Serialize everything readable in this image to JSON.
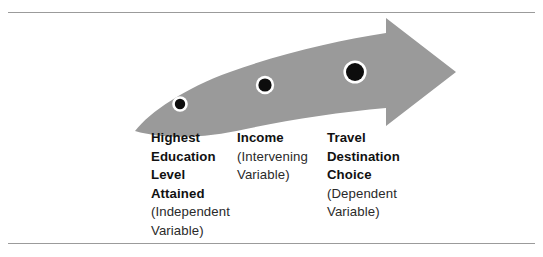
{
  "figure": {
    "title_alt": "Curved arrow diagram of variable relationships",
    "background_color": "#ffffff",
    "rule_color": "#9b9b9b",
    "arrow_color": "#9a9a9a",
    "dot_color": "#0d0d0d",
    "dot_ring_color": "#ffffff",
    "text_color": "#1c1c1c"
  },
  "chart_data": {
    "type": "diagram",
    "title": "",
    "nodes": [
      {
        "index": 0,
        "role": "independent",
        "dot": {
          "cx": 180,
          "cy": 104,
          "r": 5.2
        },
        "lines": [
          {
            "text": "Highest",
            "style": "bold"
          },
          {
            "text": "Education",
            "style": "bold"
          },
          {
            "text": "Level",
            "style": "bold"
          },
          {
            "text": "Attained",
            "style": "bold"
          },
          {
            "text": "(Independent",
            "style": "plain"
          },
          {
            "text": "Variable)",
            "style": "plain"
          }
        ]
      },
      {
        "index": 1,
        "role": "intervening",
        "dot": {
          "cx": 265,
          "cy": 85,
          "r": 6.6
        },
        "lines": [
          {
            "text": "Income",
            "style": "bold"
          },
          {
            "text": "(Intervening",
            "style": "plain"
          },
          {
            "text": "Variable)",
            "style": "plain"
          }
        ]
      },
      {
        "index": 2,
        "role": "dependent",
        "dot": {
          "cx": 355,
          "cy": 72,
          "r": 9.0
        },
        "lines": [
          {
            "text": "Travel",
            "style": "bold"
          },
          {
            "text": "Destination",
            "style": "bold"
          },
          {
            "text": "Choice",
            "style": "bold"
          },
          {
            "text": "(Dependent",
            "style": "plain"
          },
          {
            "text": "Variable)",
            "style": "plain"
          }
        ]
      }
    ]
  }
}
